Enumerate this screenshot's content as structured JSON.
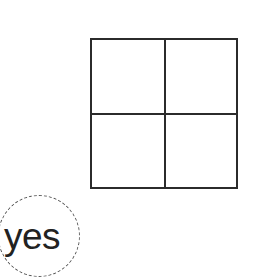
{
  "diagram": {
    "grid": {
      "rows": 2,
      "cols": 2,
      "cells": [
        "",
        "",
        "",
        ""
      ],
      "line_color": "#2b2b2b"
    },
    "annotation": {
      "text": "yes",
      "shape": "dashed-circle",
      "color": "#222222"
    }
  }
}
